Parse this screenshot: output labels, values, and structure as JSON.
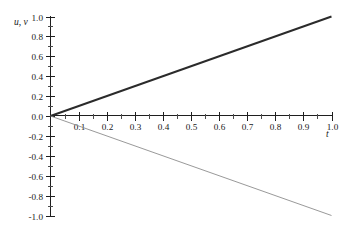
{
  "figure": {
    "background_color": "#ffffff",
    "width": 345,
    "height": 229
  },
  "chart_data": {
    "type": "line",
    "title": "",
    "subtitle": "",
    "xlabel": "t",
    "ylabel": "u, v",
    "xlim": [
      0.0,
      1.0
    ],
    "ylim": [
      -1.0,
      1.0
    ],
    "grid": false,
    "legend_position": "none",
    "x_tick_labels": [
      "0.1",
      "0.2",
      "0.3",
      "0.4",
      "0.5",
      "0.6",
      "0.7",
      "0.8",
      "0.9",
      "1.0"
    ],
    "x_tick_values": [
      0.1,
      0.2,
      0.3,
      0.4,
      0.5,
      0.6,
      0.7,
      0.8,
      0.9,
      1.0
    ],
    "x_minor_tick_values": [
      0.05,
      0.15,
      0.25,
      0.35,
      0.45,
      0.55,
      0.65,
      0.75,
      0.85,
      0.95
    ],
    "y_tick_labels": [
      "1.0",
      "0.8",
      "0.6",
      "0.4",
      "0.2",
      "0.0",
      "-0.2",
      "-0.4",
      "-0.6",
      "-0.8",
      "-1.0"
    ],
    "y_tick_values": [
      1.0,
      0.8,
      0.6,
      0.4,
      0.2,
      0.0,
      -0.2,
      -0.4,
      -0.6,
      -0.8,
      -1.0
    ],
    "y_minor_tick_values": [
      0.9,
      0.7,
      0.5,
      0.3,
      0.1,
      -0.1,
      -0.3,
      -0.5,
      -0.7,
      -0.9
    ],
    "x": [
      0.0,
      1.0
    ],
    "series": [
      {
        "name": "u",
        "values": [
          0.0,
          1.0
        ],
        "slope": 1.0,
        "intercept": 0.0,
        "color": "#2b2b2b",
        "width": 1.9
      },
      {
        "name": "v",
        "values": [
          0.0,
          -1.0
        ],
        "slope": -1.0,
        "intercept": 0.0,
        "color": "#8d8d8d",
        "width": 0.9
      }
    ],
    "annotations": []
  }
}
